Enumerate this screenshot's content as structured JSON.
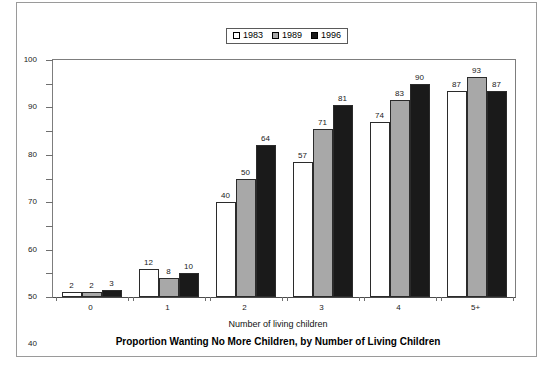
{
  "chart_data": {
    "type": "bar",
    "title": "Proportion Wanting No More Children, by Number of Living Children",
    "xlabel": "Number of living children",
    "ylabel": "",
    "categories": [
      "0",
      "1",
      "2",
      "3",
      "4",
      "5+"
    ],
    "series": [
      {
        "name": "1983",
        "color": "#ffffff",
        "values": [
          2,
          12,
          40,
          57,
          74,
          87
        ]
      },
      {
        "name": "1989",
        "color": "#a8a8a8",
        "values": [
          2,
          8,
          50,
          71,
          83,
          93
        ]
      },
      {
        "name": "1996",
        "color": "#1a1a1a",
        "values": [
          3,
          10,
          64,
          81,
          90,
          87
        ]
      }
    ],
    "ylim": [
      0,
      100
    ],
    "yticks": [
      0,
      10,
      20,
      30,
      40,
      50,
      60,
      70,
      80,
      90,
      100
    ],
    "grid": false,
    "legend_position": "top-center",
    "data_labels": true
  },
  "legend": {
    "entries": [
      {
        "label": "1983",
        "swatch": "legend-swatch-1983"
      },
      {
        "label": "1989",
        "swatch": "legend-swatch-1989"
      },
      {
        "label": "1996",
        "swatch": "legend-swatch-1996"
      }
    ]
  }
}
